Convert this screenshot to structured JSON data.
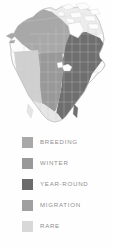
{
  "map": {
    "title": "North America range map",
    "region": "North America",
    "projection_note": "Continental outline with state and province boundaries",
    "background_color": "#fefefe",
    "outline_color": "#b9b9b9",
    "boundary_color": "#cdcdcd",
    "areas": [
      {
        "name": "alaska-and-western-canada",
        "category": "BREEDING",
        "color": "#a8a8a8"
      },
      {
        "name": "northern-canada",
        "category": "RARE",
        "color": "#ededed"
      },
      {
        "name": "eastern-us-and-eastern-canada",
        "category": "YEAR-ROUND",
        "color": "#6b6b6b"
      },
      {
        "name": "central-us",
        "category": "WINTER",
        "color": "#999999"
      },
      {
        "name": "western-us",
        "category": "MIGRATION",
        "color": "#d0d0d0"
      },
      {
        "name": "southwest-and-mexico",
        "category": "RARE",
        "color": "#e3e3e3"
      }
    ]
  },
  "legend": {
    "items": [
      {
        "label": "BREEDING",
        "color": "#a8a8a8"
      },
      {
        "label": "WINTER",
        "color": "#999999"
      },
      {
        "label": "YEAR-ROUND",
        "color": "#6b6b6b"
      },
      {
        "label": "MIGRATION",
        "color": "#a0a0a0"
      },
      {
        "label": "RARE",
        "color": "#d8d8d8"
      }
    ]
  }
}
